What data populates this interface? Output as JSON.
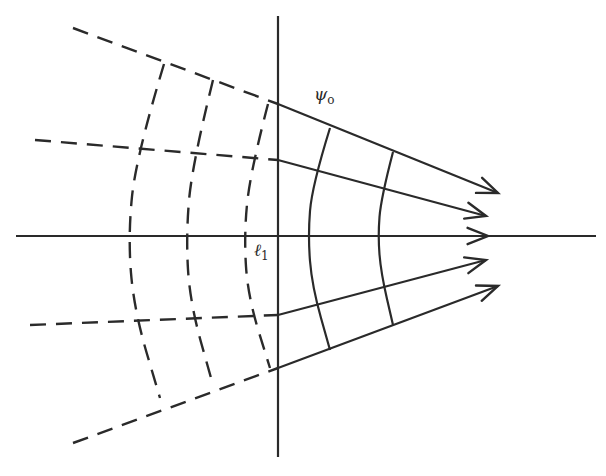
{
  "diagram": {
    "type": "wavefront-ray-diagram",
    "colors": {
      "ink": "#2a2a2a",
      "background": "#ffffff"
    },
    "labels": {
      "psi": {
        "symbol": "ψ",
        "subscript": "o"
      },
      "ell": {
        "symbol": "ℓ",
        "subscript": "1"
      }
    },
    "axes": {
      "vertical": {
        "x": 278,
        "y1": 16,
        "y2": 457
      },
      "horizontal": {
        "y": 236,
        "x1": 16,
        "x2": 596
      }
    },
    "rays": [
      {
        "dashed_from": [
          73,
          28
        ],
        "plane_cross": [
          278,
          104
        ],
        "tip": [
          498,
          193
        ]
      },
      {
        "dashed_from": [
          35,
          140
        ],
        "plane_cross": [
          278,
          160
        ],
        "tip": [
          486,
          216
        ]
      },
      {
        "dashed_from": [
          16,
          236
        ],
        "plane_cross": [
          278,
          236
        ],
        "tip": [
          488,
          236
        ]
      },
      {
        "dashed_from": [
          30,
          325
        ],
        "plane_cross": [
          278,
          315
        ],
        "tip": [
          486,
          260
        ]
      },
      {
        "dashed_from": [
          73,
          443
        ],
        "plane_cross": [
          278,
          368
        ],
        "tip": [
          498,
          286
        ]
      }
    ],
    "dashed_wavefronts": [
      {
        "points": [
          [
            164,
            64
          ],
          [
            136,
            157
          ],
          [
            128,
            236
          ],
          [
            134,
            310
          ],
          [
            160,
            398
          ]
        ]
      },
      {
        "points": [
          [
            213,
            80
          ],
          [
            192,
            165
          ],
          [
            186,
            236
          ],
          [
            190,
            303
          ],
          [
            213,
            385
          ]
        ]
      },
      {
        "points": [
          [
            268,
            104
          ],
          [
            250,
            173
          ],
          [
            244,
            236
          ],
          [
            248,
            297
          ],
          [
            270,
            368
          ]
        ]
      }
    ],
    "solid_wavefronts": [
      {
        "points": [
          [
            330,
            128
          ],
          [
            312,
            186
          ],
          [
            308,
            236
          ],
          [
            312,
            286
          ],
          [
            330,
            350
          ]
        ]
      },
      {
        "points": [
          [
            393,
            152
          ],
          [
            381,
            198
          ],
          [
            378,
            236
          ],
          [
            381,
            273
          ],
          [
            393,
            325
          ]
        ]
      }
    ]
  }
}
